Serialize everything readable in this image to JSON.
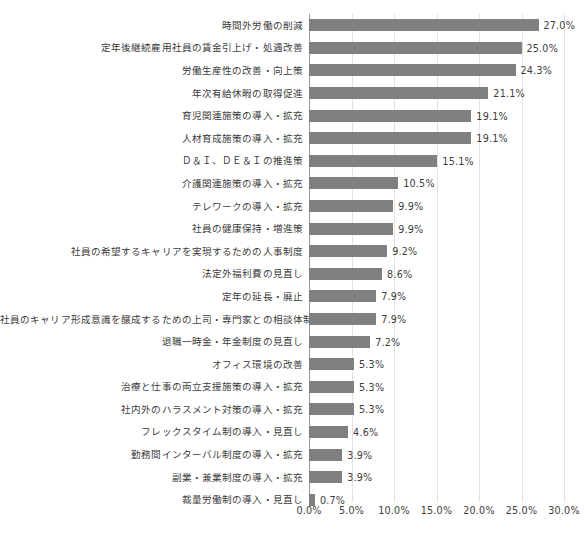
{
  "chart_data": {
    "type": "bar",
    "orientation": "horizontal",
    "title": "",
    "xlabel": "",
    "ylabel": "",
    "xlim": [
      0,
      30
    ],
    "xtick_labels": [
      "0.0%",
      "5.0%",
      "10.0%",
      "15.0%",
      "20.0%",
      "25.0%",
      "30.0%"
    ],
    "xtick_values": [
      0,
      5,
      10,
      15,
      20,
      25,
      30
    ],
    "grid": true,
    "legend": false,
    "bar_color": "#808080",
    "value_suffix": "%",
    "categories": [
      "時間外労働の削減",
      "定年後継続雇用社員の賃金引上げ・処遇改善",
      "労働生産性の改善・向上策",
      "年次有給休暇の取得促進",
      "育児関連施策の導入・拡充",
      "人材育成施策の導入・拡充",
      "Ｄ＆Ｉ、ＤＥ＆Ｉの推進策",
      "介護関連施策の導入・拡充",
      "テレワークの導入・拡充",
      "社員の健康保持・増進策",
      "社員の希望するキャリアを実現するための人事制度",
      "法定外福利費の見直し",
      "定年の延長・廃止",
      "社員のキャリア形成意識を醸成するための上司・専門家との相談体制",
      "退職一時金・年金制度の見直し",
      "オフィス環境の改善",
      "治療と仕事の両立支援施策の導入・拡充",
      "社内外のハラスメント対策の導入・拡充",
      "フレックスタイム制の導入・見直し",
      "勤務間インターバル制度の導入・拡充",
      "副業・兼業制度の導入・拡充",
      "裁量労働制の導入・見直し"
    ],
    "values": [
      27.0,
      25.0,
      24.3,
      21.1,
      19.1,
      19.1,
      15.1,
      10.5,
      9.9,
      9.9,
      9.2,
      8.6,
      7.9,
      7.9,
      7.2,
      5.3,
      5.3,
      5.3,
      4.6,
      3.9,
      3.9,
      0.7
    ],
    "value_labels": [
      "27.0%",
      "25.0%",
      "24.3%",
      "21.1%",
      "19.1%",
      "19.1%",
      "15.1%",
      "10.5%",
      "9.9%",
      "9.9%",
      "9.2%",
      "8.6%",
      "7.9%",
      "7.9%",
      "7.2%",
      "5.3%",
      "5.3%",
      "5.3%",
      "4.6%",
      "3.9%",
      "3.9%",
      "0.7%"
    ]
  }
}
